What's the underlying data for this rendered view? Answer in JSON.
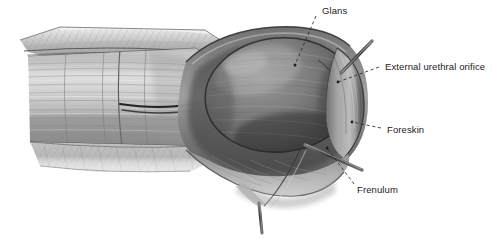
{
  "figure": {
    "type": "anatomical-illustration",
    "style": "grayscale pencil / airbrush medical drawing",
    "background_color": "#ffffff",
    "width": 501,
    "height": 243
  },
  "palette": {
    "background": "#ffffff",
    "label_text": "#1b1b1b",
    "leader_line": "#2a2a2a",
    "glans_dark": "#4a4a4a",
    "glans_mid": "#7d7d7d",
    "glans_light": "#a8a8a8",
    "shaft_light": "#d2d2d2",
    "shaft_mid": "#b4b4b4",
    "shaft_shadow": "#8a8a8a",
    "foreskin_rim": "#9a9a9a",
    "probe_metal": "#555555",
    "outline": "#3c3c3c"
  },
  "labels": [
    {
      "id": "glans",
      "text": "Glans",
      "x": 322,
      "y": 5,
      "leader": {
        "x1": 316,
        "y1": 16,
        "x2": 295,
        "y2": 65
      }
    },
    {
      "id": "external-urethral-orifice",
      "text": "External urethral orifice",
      "x": 385,
      "y": 61,
      "leader": {
        "x1": 379,
        "y1": 67,
        "x2": 338,
        "y2": 82
      }
    },
    {
      "id": "foreskin",
      "text": "Foreskin",
      "x": 387,
      "y": 124,
      "leader": {
        "x1": 381,
        "y1": 128,
        "x2": 352,
        "y2": 122
      }
    },
    {
      "id": "frenulum",
      "text": "Frenulum",
      "x": 357,
      "y": 184,
      "leader": {
        "x1": 354,
        "y1": 184,
        "x2": 327,
        "y2": 148
      }
    }
  ],
  "instruments": [
    {
      "id": "urethral-probe",
      "description": "metal probe inserted in external urethral orifice",
      "x1": 341,
      "y1": 73,
      "x2": 372,
      "y2": 41
    },
    {
      "id": "frenulum-probe",
      "description": "metal probe lifting the frenulum",
      "x1": 305,
      "y1": 145,
      "x2": 362,
      "y2": 170
    },
    {
      "id": "lower-stem",
      "description": "thin stem descending from lower foreskin margin",
      "x1": 259,
      "y1": 203,
      "x2": 262,
      "y2": 233
    }
  ],
  "regions": [
    {
      "id": "shaft",
      "description": "penile shaft, skin partly reflected, longitudinal striations"
    },
    {
      "id": "glans",
      "description": "glans penis, large ovoid dome, mottled texture"
    },
    {
      "id": "foreskin-rim",
      "description": "retracted foreskin collar at right of glans"
    },
    {
      "id": "lower-skin-flap",
      "description": "reflected skin flap beneath shaft"
    }
  ]
}
